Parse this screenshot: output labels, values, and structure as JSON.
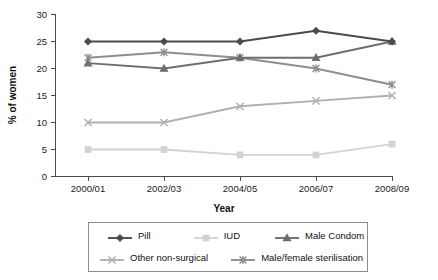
{
  "chart_data": {
    "type": "line",
    "title": "",
    "subtitle": "",
    "xlabel": "Year",
    "ylabel": "% of women",
    "categories": [
      "2000/01",
      "2002/03",
      "2004/05",
      "2006/07",
      "2008/09"
    ],
    "x": [
      "2000/01",
      "2002/03",
      "2004/05",
      "2006/07",
      "2008/09"
    ],
    "ylim": [
      0,
      30
    ],
    "yticks": [
      0,
      5,
      10,
      15,
      20,
      25,
      30
    ],
    "ytick_labels": [
      "0",
      "5",
      "10",
      "15",
      "20",
      "25",
      "30"
    ],
    "grid": false,
    "legend_position": "bottom",
    "series": [
      {
        "name": "Pill",
        "values": [
          25,
          25,
          25,
          27,
          25
        ],
        "color": "#4b4b4b",
        "marker": "diamond"
      },
      {
        "name": "IUD",
        "values": [
          5,
          5,
          4,
          4,
          6
        ],
        "color": "#d2d2d2",
        "marker": "square"
      },
      {
        "name": "Male Condom",
        "values": [
          21,
          20,
          22,
          22,
          25
        ],
        "color": "#6e6e6e",
        "marker": "triangle"
      },
      {
        "name": "Other non-surgical",
        "values": [
          10,
          10,
          13,
          14,
          15
        ],
        "color": "#b0b0b0",
        "marker": "cross-x"
      },
      {
        "name": "Male/female sterilisation",
        "values": [
          22,
          23,
          22,
          20,
          17
        ],
        "color": "#8e8e8e",
        "marker": "asterisk"
      }
    ]
  },
  "axes": {
    "y_title": "% of women",
    "x_title": "Year",
    "y_ticks": [
      "30",
      "25",
      "20",
      "15",
      "10",
      "5",
      "0"
    ],
    "x_ticks": [
      "2000/01",
      "2002/03",
      "2004/05",
      "2006/07",
      "2008/09"
    ]
  },
  "legend": {
    "row1": [
      {
        "label": "Pill",
        "color": "#4b4b4b",
        "marker": "diamond"
      },
      {
        "label": "IUD",
        "color": "#d2d2d2",
        "marker": "square"
      },
      {
        "label": "Male Condom",
        "color": "#6e6e6e",
        "marker": "triangle"
      }
    ],
    "row2": [
      {
        "label": "Other non-surgical",
        "color": "#b0b0b0",
        "marker": "cross-x"
      },
      {
        "label": "Male/female sterilisation",
        "color": "#8e8e8e",
        "marker": "asterisk"
      }
    ]
  }
}
